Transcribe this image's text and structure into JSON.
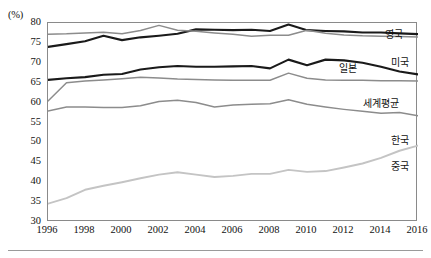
{
  "figure": {
    "unit_label": "(%)",
    "y_ticks": [
      30,
      35,
      40,
      45,
      50,
      55,
      60,
      65,
      70,
      75,
      80
    ],
    "x_ticks": [
      1996,
      1998,
      2000,
      2002,
      2004,
      2006,
      2008,
      2010,
      2012,
      2014,
      2016
    ],
    "series_labels": {
      "uk": "영국",
      "usa": "미국",
      "japan": "일본",
      "world": "세계평균",
      "korea": "한국",
      "china": "중국"
    },
    "colors": {
      "uk": "#1a1a1a",
      "usa": "#8c8c8c",
      "japan": "#1a1a1a",
      "world": "#8c8c8c",
      "korea": "#8c8c8c",
      "china": "#c4c4c4",
      "frame": "#8a8a8a",
      "rule": "#9a9a9a"
    }
  },
  "chart_data": {
    "type": "line",
    "title": "",
    "xlabel": "",
    "ylabel": "(%)",
    "xlim": [
      1996,
      2016
    ],
    "ylim": [
      30,
      80
    ],
    "grid": false,
    "legend": "inline-right-end-labels",
    "x": [
      1996,
      1997,
      1998,
      1999,
      2000,
      2001,
      2002,
      2003,
      2004,
      2005,
      2006,
      2007,
      2008,
      2009,
      2010,
      2011,
      2012,
      2013,
      2014,
      2015,
      2016
    ],
    "series": [
      {
        "name": "영국",
        "color": "#1a1a1a",
        "values": [
          74.0,
          74.7,
          75.4,
          76.8,
          75.7,
          76.4,
          76.8,
          77.3,
          78.4,
          78.3,
          78.2,
          78.3,
          78.0,
          79.6,
          78.2,
          78.0,
          77.9,
          77.6,
          77.6,
          77.4,
          77.2
        ]
      },
      {
        "name": "미국",
        "color": "#8c8c8c",
        "values": [
          77.2,
          77.3,
          77.5,
          77.7,
          77.3,
          78.1,
          79.4,
          78.2,
          77.9,
          77.5,
          77.2,
          76.7,
          76.9,
          76.9,
          78.2,
          77.4,
          77.0,
          76.8,
          76.7,
          76.6,
          76.5
        ]
      },
      {
        "name": "일본",
        "color": "#1a1a1a",
        "values": [
          65.7,
          66.1,
          66.4,
          67.0,
          67.2,
          68.3,
          68.9,
          69.2,
          69.0,
          69.0,
          69.1,
          69.2,
          68.6,
          70.8,
          69.4,
          70.8,
          70.6,
          70.0,
          69.0,
          67.8,
          67.1
        ]
      },
      {
        "name": "세계평균",
        "color": "#8c8c8c",
        "values": [
          60.4,
          65.0,
          65.4,
          65.7,
          66.0,
          66.4,
          66.2,
          65.9,
          65.8,
          65.7,
          65.6,
          65.6,
          65.6,
          67.4,
          66.1,
          65.7,
          65.6,
          65.6,
          65.5,
          65.5,
          65.4
        ]
      },
      {
        "name": "한국",
        "color": "#8c8c8c",
        "values": [
          57.9,
          58.9,
          58.9,
          58.8,
          58.8,
          59.2,
          60.3,
          60.6,
          60.0,
          58.9,
          59.4,
          59.6,
          59.7,
          60.7,
          59.6,
          58.9,
          58.3,
          57.8,
          57.3,
          57.5,
          56.7
        ]
      },
      {
        "name": "중국",
        "color": "#c4c4c4",
        "values": [
          34.6,
          36.0,
          38.1,
          39.1,
          40.0,
          41.0,
          41.9,
          42.5,
          41.9,
          41.3,
          41.6,
          42.1,
          42.1,
          43.1,
          42.6,
          42.8,
          43.7,
          44.7,
          46.1,
          47.9,
          49.2
        ]
      }
    ]
  }
}
